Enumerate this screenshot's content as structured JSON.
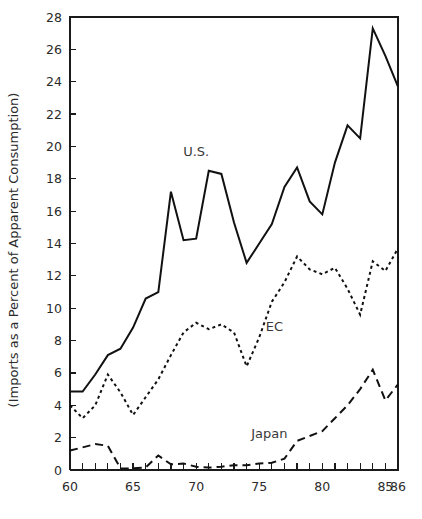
{
  "chart_data": {
    "type": "line",
    "title": "",
    "xlabel": "",
    "ylabel": "(Imports as a Percent of Apparent Consumption)",
    "xlim": [
      60,
      86
    ],
    "ylim": [
      0,
      28
    ],
    "grid": false,
    "legend_position": "inline-annotations",
    "x": [
      60,
      61,
      62,
      63,
      64,
      65,
      66,
      67,
      68,
      69,
      70,
      71,
      72,
      73,
      74,
      75,
      76,
      77,
      78,
      79,
      80,
      81,
      82,
      83,
      84,
      85,
      86
    ],
    "x_tick_values": [
      60,
      61,
      62,
      63,
      64,
      65,
      66,
      67,
      68,
      69,
      70,
      71,
      72,
      73,
      74,
      75,
      76,
      77,
      78,
      79,
      80,
      81,
      82,
      83,
      84,
      85,
      86
    ],
    "x_tick_labels": [
      "60",
      "",
      "",
      "",
      "",
      "65",
      "",
      "",
      "",
      "",
      "70",
      "",
      "",
      "",
      "",
      "75",
      "",
      "",
      "",
      "",
      "80",
      "",
      "",
      "",
      "",
      "85",
      "86"
    ],
    "y_tick_values": [
      0,
      2,
      4,
      6,
      8,
      10,
      12,
      14,
      16,
      18,
      20,
      22,
      24,
      26,
      28
    ],
    "y_tick_labels": [
      "0",
      "2",
      "4",
      "6",
      "8",
      "10",
      "12",
      "14",
      "16",
      "18",
      "20",
      "22",
      "24",
      "26",
      "28"
    ],
    "series": [
      {
        "name": "U.S.",
        "style": "solid",
        "label_x": 70,
        "label_y": 19.4,
        "values": [
          4.85,
          4.85,
          5.9,
          7.1,
          7.5,
          8.8,
          10.6,
          11.0,
          17.2,
          14.2,
          14.3,
          18.5,
          18.3,
          15.3,
          12.8,
          14.0,
          15.2,
          17.5,
          18.7,
          16.6,
          15.8,
          19.0,
          21.3,
          20.5,
          27.3,
          25.6,
          23.7
        ]
      },
      {
        "name": "EC",
        "style": "dotted",
        "label_x": 76.2,
        "label_y": 8.6,
        "values": [
          4.0,
          3.2,
          4.0,
          5.9,
          4.8,
          3.4,
          4.5,
          5.6,
          7.1,
          8.5,
          9.1,
          8.7,
          9.0,
          8.5,
          6.4,
          8.2,
          10.4,
          11.6,
          13.2,
          12.4,
          12.1,
          12.5,
          11.2,
          9.6,
          12.9,
          12.3,
          13.7
        ]
      },
      {
        "name": "Japan",
        "style": "dashed",
        "label_x": 75.8,
        "label_y": 2.0,
        "values": [
          1.2,
          1.4,
          1.6,
          1.5,
          0.1,
          0.1,
          0.15,
          0.9,
          0.35,
          0.4,
          0.2,
          0.15,
          0.2,
          0.3,
          0.3,
          0.4,
          0.45,
          0.7,
          1.8,
          2.1,
          2.4,
          3.2,
          4.0,
          5.0,
          6.2,
          4.3,
          5.3
        ]
      }
    ]
  }
}
